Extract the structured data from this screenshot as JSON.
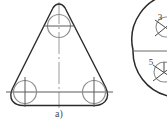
{
  "figure": {
    "caption": "a)",
    "background_color": "#ffffff",
    "outline_color": "#2b2b2b",
    "centerline_color": "#8a8a8a",
    "hole_color": "#8f8f8f",
    "label_color": "#3a3a3a"
  },
  "left_view": {
    "name": "triangular-plate-view",
    "shape": "rounded-equilateral-triangle",
    "holes": [
      {
        "id": "top-hole",
        "cx": 59,
        "cy": 26,
        "r": 11.5
      },
      {
        "id": "bottom-left-hole",
        "cx": 25,
        "cy": 92,
        "r": 11.5
      },
      {
        "id": "bottom-right-hole",
        "cx": 94,
        "cy": 92,
        "r": 11.5
      }
    ],
    "vertical_centerline": {
      "x": 59,
      "y1": 2,
      "y2": 108
    }
  },
  "right_view": {
    "name": "circular-flange-view",
    "shape": "partial-circle",
    "labels": [
      {
        "id": "label-3",
        "text": "3",
        "x": 163,
        "y": 17
      },
      {
        "id": "label-5",
        "text": "5",
        "x": 152,
        "y": 62
      }
    ],
    "horizontal_centerline": {
      "y": 51,
      "x1": 136,
      "x2": 167
    },
    "detail_circles": [
      {
        "id": "detail-circle-upper",
        "cx": 166,
        "cy": 27,
        "r": 10
      },
      {
        "id": "detail-circle-lower",
        "cx": 163,
        "cy": 72,
        "r": 10
      }
    ]
  }
}
